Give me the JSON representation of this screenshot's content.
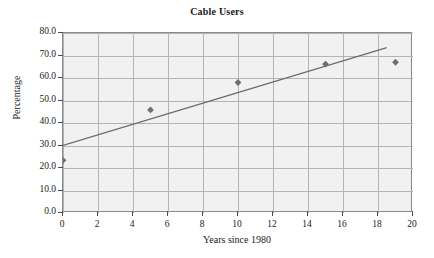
{
  "chart_data": {
    "type": "scatter",
    "title": "Cable Users",
    "xlabel": "Years since 1980",
    "ylabel": "Percentage",
    "xlim": [
      0,
      20
    ],
    "ylim": [
      0,
      80
    ],
    "grid": true,
    "legend": "none",
    "x_ticks": [
      "0",
      "2",
      "4",
      "6",
      "8",
      "10",
      "12",
      "14",
      "16",
      "18",
      "20"
    ],
    "x_tick_values": [
      0,
      2,
      4,
      6,
      8,
      10,
      12,
      14,
      16,
      18,
      20
    ],
    "y_ticks": [
      "0.0",
      "10.0",
      "20.0",
      "30.0",
      "40.0",
      "50.0",
      "60.0",
      "70.0",
      "80.0"
    ],
    "y_tick_values": [
      0,
      10,
      20,
      30,
      40,
      50,
      60,
      70,
      80
    ],
    "series": [
      {
        "name": "Cable Users",
        "type": "scatter",
        "marker": "diamond",
        "color": "#6e6e6e",
        "points": [
          {
            "x": 0,
            "y": 23.4
          },
          {
            "x": 5,
            "y": 45.8
          },
          {
            "x": 10,
            "y": 58.0
          },
          {
            "x": 15,
            "y": 66.2
          },
          {
            "x": 19,
            "y": 67.0
          }
        ]
      },
      {
        "name": "Trend line",
        "type": "line",
        "color": "#6b6b6b",
        "points": [
          {
            "x": 0,
            "y": 30.0
          },
          {
            "x": 18.5,
            "y": 73.5
          }
        ]
      }
    ]
  },
  "axes": {
    "background": "#f1f1f1",
    "border_color": "#8a8a8a",
    "gridline_color": "#b4b4b4"
  }
}
